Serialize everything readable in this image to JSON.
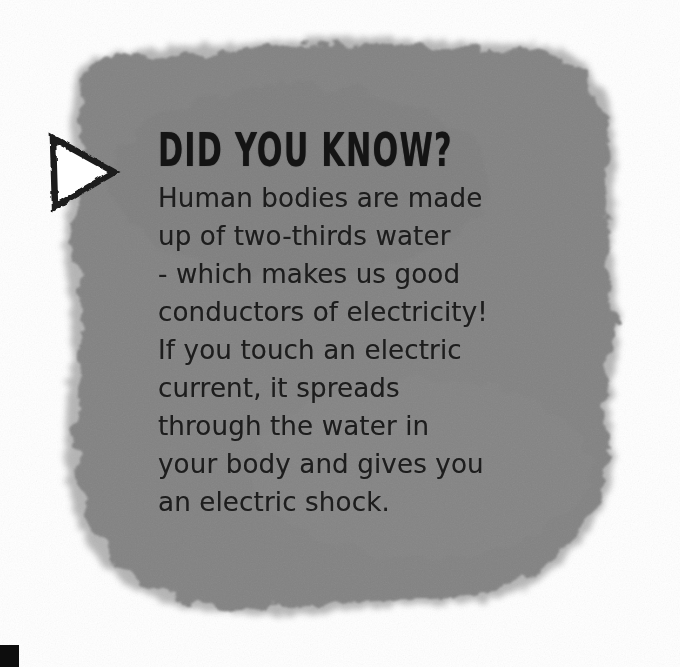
{
  "card": {
    "headline": "DID YOU KNOW?",
    "marker_icon": "triangle-right-icon",
    "body_lines": [
      "Human bodies are made",
      "up of two-thirds water",
      "- which makes us good",
      "conductors of electricity!",
      "If you touch an electric",
      "current, it spreads",
      "through the water in",
      "your body and gives you",
      "an electric shock."
    ],
    "body_text": "Human bodies are made up of two-thirds water - which makes us good conductors of electricity! If you touch an electric current, it spreads through the water in your body and gives you an electric shock.",
    "colors": {
      "page_background": "#ffffff",
      "blob_fill": "#828282",
      "blob_edge": "#9a9a9a",
      "headline_text": "#141414",
      "body_text": "#1d1d1d",
      "marker_stroke": "#1a1a1a",
      "marker_fill": "#ffffff",
      "corner_mark": "#0d0d0d"
    }
  }
}
